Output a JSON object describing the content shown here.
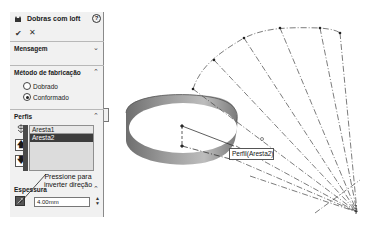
{
  "panel": {
    "title": "Dobras com loft",
    "help_icon": "?",
    "ok_icon": "✔",
    "cancel_icon": "✕",
    "sections": {
      "message": {
        "label": "Mensagem",
        "chevron": "⌄"
      },
      "method": {
        "label": "Método de fabricação",
        "chevron": "⌃",
        "options": [
          {
            "label": "Dobrado",
            "checked": false
          },
          {
            "label": "Conformado",
            "checked": true
          }
        ]
      },
      "profiles": {
        "label": "Perfis",
        "chevron": "⌃",
        "items": [
          "Aresta1",
          "Aresta2"
        ],
        "up_icon": "🡅",
        "down_icon": "🡇"
      },
      "thickness": {
        "label": "Espessura",
        "chevron": "⌃",
        "value": "4.00mm"
      }
    },
    "annotation": "Pressione para inverter direção"
  },
  "viewport": {
    "callout_label": "Perfil(Aresta2)"
  }
}
